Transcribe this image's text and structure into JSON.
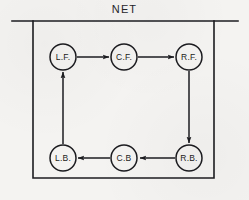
{
  "figure": {
    "title": "NET",
    "background_color": "#f4f3f1",
    "ink_color": "#1c1c20"
  },
  "frame": {
    "top_rule": {
      "x1": 12,
      "x2": 238,
      "y": 21
    },
    "box": {
      "x": 33,
      "y": 21,
      "width": 181,
      "height": 157
    }
  },
  "diagram": {
    "type": "directed-cycle",
    "node_radius": 13,
    "nodes": [
      {
        "id": "LF",
        "label": "L.F.",
        "cx": 63,
        "cy": 57
      },
      {
        "id": "CF",
        "label": "C.F.",
        "cx": 124,
        "cy": 57
      },
      {
        "id": "RF",
        "label": "R.F.",
        "cx": 189,
        "cy": 57
      },
      {
        "id": "LB",
        "label": "L.B.",
        "cx": 63,
        "cy": 158
      },
      {
        "id": "CB",
        "label": "C.B",
        "cx": 124,
        "cy": 158
      },
      {
        "id": "RB",
        "label": "R.B.",
        "cx": 189,
        "cy": 158
      }
    ],
    "edges": [
      {
        "from": "LF",
        "to": "CF",
        "direction": "right"
      },
      {
        "from": "CF",
        "to": "RF",
        "direction": "right"
      },
      {
        "from": "RF",
        "to": "RB",
        "direction": "down"
      },
      {
        "from": "RB",
        "to": "CB",
        "direction": "left"
      },
      {
        "from": "CB",
        "to": "LB",
        "direction": "left"
      },
      {
        "from": "LB",
        "to": "LF",
        "direction": "up"
      }
    ]
  }
}
